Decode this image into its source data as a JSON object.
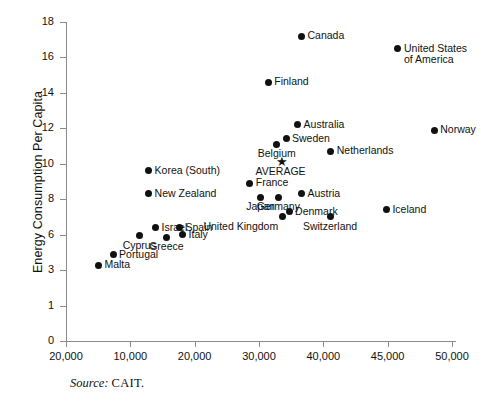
{
  "chart_data": {
    "type": "scatter",
    "title": "",
    "xlabel": "",
    "ylabel": "Energy Consumption Per Capita",
    "source_note": {
      "label": "Source:",
      "value": "CAIT."
    },
    "grid": false,
    "legend": false,
    "marker_style": "filled-circle",
    "average_marker_style": "star",
    "y_tick_labels": [
      "18",
      "16",
      "14",
      "12",
      "10",
      "8",
      "6",
      "3",
      "1",
      "0"
    ],
    "x_tick_labels": [
      "20,000",
      "10,000",
      "20,000",
      "30,000",
      "40,000",
      "45,000",
      "50,000"
    ],
    "ylim": [
      0,
      18
    ],
    "xlim": [
      0,
      50000
    ],
    "points": [
      {
        "name": "Canada",
        "x": 30500,
        "y": 17.2,
        "label": "Canada",
        "label_pos": "right"
      },
      {
        "name": "United States of America",
        "x": 43000,
        "y": 16.5,
        "label": "United States\nof America",
        "label_pos": "right"
      },
      {
        "name": "Finland",
        "x": 26200,
        "y": 14.6,
        "label": "Finland",
        "label_pos": "right"
      },
      {
        "name": "Norway",
        "x": 47700,
        "y": 11.9,
        "label": "Norway",
        "label_pos": "right"
      },
      {
        "name": "Australia",
        "x": 30000,
        "y": 12.2,
        "label": "Australia",
        "label_pos": "right"
      },
      {
        "name": "Sweden",
        "x": 28500,
        "y": 11.4,
        "label": "Sweden",
        "label_pos": "right"
      },
      {
        "name": "Belgium",
        "x": 27300,
        "y": 11.1,
        "label": "Belgium",
        "label_pos": "below"
      },
      {
        "name": "Netherlands",
        "x": 34300,
        "y": 10.7,
        "label": "Netherlands",
        "label_pos": "right"
      },
      {
        "name": "AVERAGE",
        "x": 27800,
        "y": 10.1,
        "label": "AVERAGE",
        "label_pos": "below",
        "marker": "star"
      },
      {
        "name": "Korea (South)",
        "x": 10700,
        "y": 9.6,
        "label": "Korea (South)",
        "label_pos": "right"
      },
      {
        "name": "France",
        "x": 23800,
        "y": 8.9,
        "label": "France",
        "label_pos": "right"
      },
      {
        "name": "New Zealand",
        "x": 10700,
        "y": 8.3,
        "label": "New Zealand",
        "label_pos": "right"
      },
      {
        "name": "Austria",
        "x": 30500,
        "y": 8.3,
        "label": "Austria",
        "label_pos": "right"
      },
      {
        "name": "Japan",
        "x": 25200,
        "y": 8.1,
        "label": "Japan",
        "label_pos": "below"
      },
      {
        "name": "Germany",
        "x": 27500,
        "y": 8.1,
        "label": "Germany",
        "label_pos": "below"
      },
      {
        "name": "Denmark",
        "x": 28900,
        "y": 7.3,
        "label": "Denmark",
        "label_pos": "right"
      },
      {
        "name": "United Kingdom",
        "x": 28000,
        "y": 7.0,
        "label": "United Kingdom",
        "label_pos": "below-left"
      },
      {
        "name": "Switzerland",
        "x": 34200,
        "y": 7.0,
        "label": "Switzerland",
        "label_pos": "below"
      },
      {
        "name": "Iceland",
        "x": 41500,
        "y": 7.4,
        "label": "Iceland",
        "label_pos": "right"
      },
      {
        "name": "Spain",
        "x": 14700,
        "y": 6.4,
        "label": "Spain",
        "label_pos": "right"
      },
      {
        "name": "Israel",
        "x": 11600,
        "y": 6.4,
        "label": "Israel",
        "label_pos": "right"
      },
      {
        "name": "Italy",
        "x": 15100,
        "y": 6.0,
        "label": "Italy",
        "label_pos": "right"
      },
      {
        "name": "Cyprus",
        "x": 9500,
        "y": 5.9,
        "label": "Cyprus",
        "label_pos": "below"
      },
      {
        "name": "Greece",
        "x": 13000,
        "y": 5.8,
        "label": "Greece",
        "label_pos": "below"
      },
      {
        "name": "Portugal",
        "x": 6100,
        "y": 4.3,
        "label": "Portugal",
        "label_pos": "right"
      },
      {
        "name": "Malta",
        "x": 4200,
        "y": 3.4,
        "label": "Malta",
        "label_pos": "right"
      }
    ]
  }
}
